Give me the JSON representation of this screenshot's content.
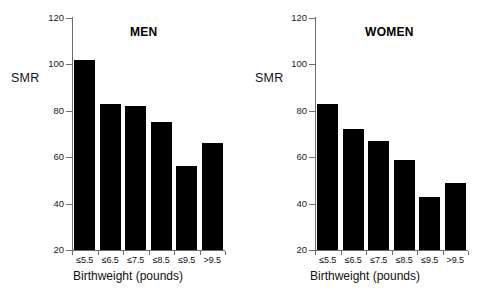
{
  "chart_data": [
    {
      "type": "bar",
      "title": "MEN",
      "categories": [
        "≤5.5",
        "≤6.5",
        "≤7.5",
        "≤8.5",
        "≤9.5",
        ">9.5"
      ],
      "values": [
        102,
        83,
        82,
        75,
        56,
        66
      ],
      "xlabel": "Birthweight (pounds)",
      "ylabel": "SMR",
      "ylim": [
        20,
        120
      ],
      "yticks": [
        20,
        40,
        60,
        80,
        100,
        120
      ],
      "ytick_labels": [
        "20",
        "40",
        "60",
        "80",
        "100",
        "120"
      ],
      "grid": false,
      "legend": false,
      "bar_color": "#000000",
      "axis_color": "#6e6e6e"
    },
    {
      "type": "bar",
      "title": "WOMEN",
      "categories": [
        "≤5.5",
        "≤6.5",
        "≤7.5",
        "≤8.5",
        "≤9.5",
        ">9.5"
      ],
      "values": [
        83,
        72,
        67,
        59,
        43,
        49
      ],
      "xlabel": "Birthweight (pounds)",
      "ylabel": "SMR",
      "ylim": [
        20,
        120
      ],
      "yticks": [
        20,
        40,
        60,
        80,
        100,
        120
      ],
      "ytick_labels": [
        "20",
        "40",
        "60",
        "80",
        "100",
        "120"
      ],
      "grid": false,
      "legend": false,
      "bar_color": "#000000",
      "axis_color": "#6e6e6e"
    }
  ],
  "figure": {
    "background": "#ffffff",
    "panels": [
      "MEN",
      "WOMEN"
    ]
  }
}
